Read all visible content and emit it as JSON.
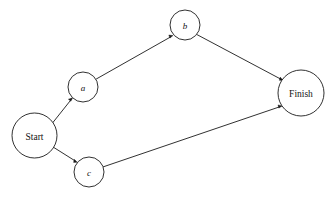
{
  "diagram": {
    "background_color": "#ffffff",
    "stroke_color": "#1a1a1a",
    "node_fill_color": "#ffffff",
    "nodes": [
      {
        "id": "start",
        "label": "Start",
        "style": "terminal",
        "cx": 34.5,
        "cy": 135.5,
        "r": 22.5
      },
      {
        "id": "a",
        "label": "a",
        "style": "activity",
        "cx": 83.0,
        "cy": 87.0,
        "r": 15.0
      },
      {
        "id": "b",
        "label": "b",
        "style": "activity",
        "cx": 185.0,
        "cy": 25.0,
        "r": 15.0
      },
      {
        "id": "c",
        "label": "c",
        "style": "activity",
        "cx": 89.0,
        "cy": 172.0,
        "r": 15.0
      },
      {
        "id": "finish",
        "label": "Finish",
        "style": "terminal",
        "cx": 301.0,
        "cy": 93.0,
        "r": 23.0
      }
    ],
    "edges": [
      {
        "id": "start-a",
        "from": "start",
        "to": "a",
        "directed": true
      },
      {
        "id": "start-c",
        "from": "start",
        "to": "c",
        "directed": true
      },
      {
        "id": "a-b",
        "from": "a",
        "to": "b",
        "directed": true
      },
      {
        "id": "b-finish",
        "from": "b",
        "to": "finish",
        "directed": true
      },
      {
        "id": "c-finish",
        "from": "c",
        "to": "finish",
        "directed": true
      }
    ]
  }
}
